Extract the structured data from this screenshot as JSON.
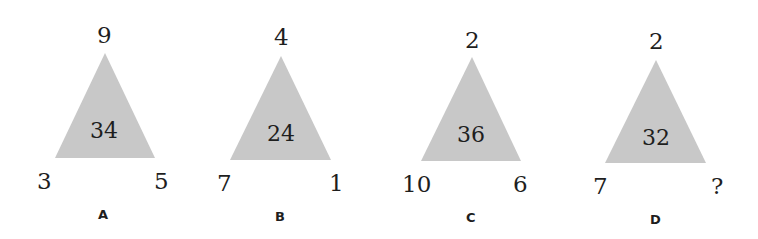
{
  "puzzles": [
    {
      "label": "A",
      "top": "9",
      "left": "3",
      "right": "5",
      "center": "34"
    },
    {
      "label": "B",
      "top": "4",
      "left": "7",
      "right": "1",
      "center": "24"
    },
    {
      "label": "C",
      "top": "2",
      "left": "10",
      "right": "6",
      "center": "36"
    },
    {
      "label": "D",
      "top": "2",
      "left": "7",
      "right": "?",
      "center": "32"
    }
  ],
  "colors": {
    "triangle_fill": "#c8c8c8",
    "text": "#1e1e1e",
    "background": "#ffffff"
  }
}
